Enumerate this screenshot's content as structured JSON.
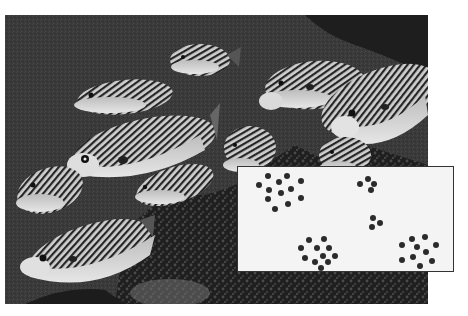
{
  "figure": {
    "photo": {
      "subject": "school of striped sweetlips fish over coral reef",
      "colormode": "grayscale",
      "colors": {
        "water": "#3a3a3a",
        "water_dark": "#1e1e1e",
        "fish_light": "#d8d8d8",
        "fish_stripe": "#2a2a2a",
        "coral": "#262626"
      }
    },
    "inset": {
      "description": "schematic of fish positions as dot clusters",
      "background": "#f4f4f4",
      "border": "#333333",
      "dot_color": "#2b2b2b",
      "clusters": [
        {
          "name": "top-left",
          "count": 12
        },
        {
          "name": "top-middle",
          "count": 4
        },
        {
          "name": "middle",
          "count": 3
        },
        {
          "name": "bottom-middle",
          "count": 11
        },
        {
          "name": "bottom-right",
          "count": 10
        }
      ]
    }
  }
}
